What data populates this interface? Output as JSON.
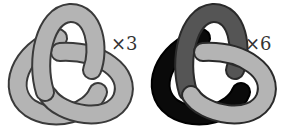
{
  "figure": {
    "type": "trefoil-knot-comparison",
    "knots": [
      {
        "name": "trefoil-single-color",
        "label": "×3",
        "colors": {
          "lobe_top": "#b4b4b4",
          "lobe_left": "#b4b4b4",
          "lobe_right": "#b4b4b4",
          "outline": "#3a3a3a"
        }
      },
      {
        "name": "trefoil-three-colored",
        "label": "×6",
        "colors": {
          "lobe_top": "#555555",
          "lobe_left": "#0a0a0a",
          "lobe_right": "#b4b4b4",
          "outline": "#2a2a2a"
        }
      }
    ]
  }
}
